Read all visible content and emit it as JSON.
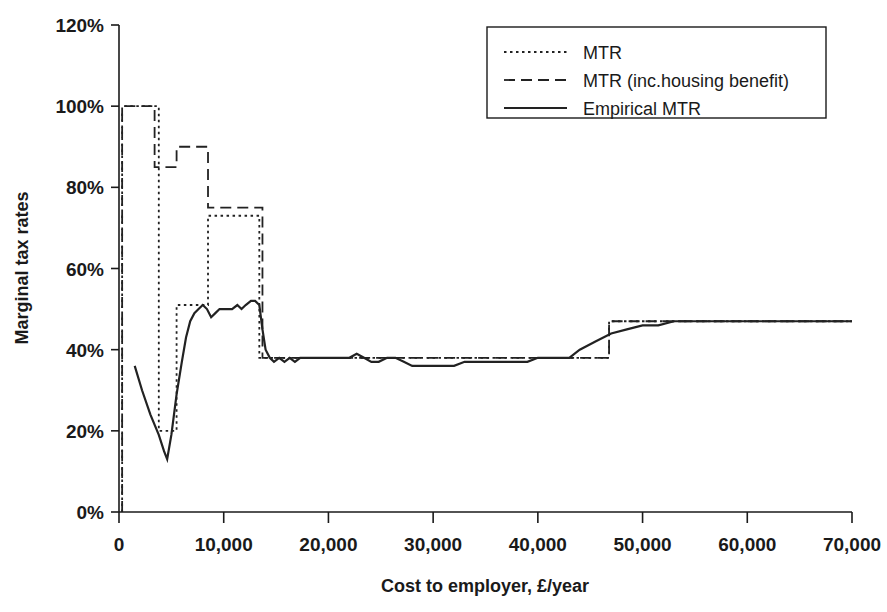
{
  "chart_data": {
    "type": "line",
    "title": "",
    "xlabel": "Cost to employer, £/year",
    "ylabel": "Marginal tax rates",
    "xlim": [
      0,
      70000
    ],
    "ylim": [
      0,
      120
    ],
    "xticks": [
      0,
      10000,
      20000,
      30000,
      40000,
      50000,
      60000,
      70000
    ],
    "xtick_labels": [
      "0",
      "10,000",
      "20,000",
      "30,000",
      "40,000",
      "50,000",
      "60,000",
      "70,000"
    ],
    "yticks": [
      0,
      20,
      40,
      60,
      80,
      100,
      120
    ],
    "ytick_labels": [
      "0%",
      "20%",
      "40%",
      "60%",
      "80%",
      "100%",
      "120%"
    ],
    "grid": false,
    "legend_position": "top-right",
    "legend_entries": [
      {
        "label": "MTR",
        "style": "dotted"
      },
      {
        "label": "MTR (inc.housing benefit)",
        "style": "dashed"
      },
      {
        "label": "Empirical MTR",
        "style": "solid"
      }
    ],
    "series": [
      {
        "name": "MTR",
        "style": "dotted",
        "step": true,
        "points": [
          [
            300,
            0
          ],
          [
            300,
            100
          ],
          [
            3800,
            100
          ],
          [
            3800,
            20
          ],
          [
            5500,
            20
          ],
          [
            5500,
            51
          ],
          [
            8500,
            51
          ],
          [
            8500,
            73
          ],
          [
            13400,
            73
          ],
          [
            13400,
            38
          ],
          [
            20000,
            38
          ],
          [
            30000,
            38
          ],
          [
            40000,
            38
          ],
          [
            46800,
            38
          ],
          [
            46800,
            47
          ],
          [
            54000,
            47
          ],
          [
            60000,
            47
          ],
          [
            70000,
            47
          ]
        ]
      },
      {
        "name": "MTR (inc.housing benefit)",
        "style": "dashed",
        "step": true,
        "points": [
          [
            300,
            0
          ],
          [
            300,
            100
          ],
          [
            3400,
            100
          ],
          [
            3400,
            85
          ],
          [
            5500,
            85
          ],
          [
            5500,
            90
          ],
          [
            8500,
            90
          ],
          [
            8500,
            75
          ],
          [
            13700,
            75
          ],
          [
            13700,
            38
          ],
          [
            20000,
            38
          ],
          [
            30000,
            38
          ],
          [
            40000,
            38
          ],
          [
            46800,
            38
          ],
          [
            46800,
            47
          ],
          [
            54000,
            47
          ],
          [
            60000,
            47
          ],
          [
            70000,
            47
          ]
        ]
      },
      {
        "name": "Empirical MTR",
        "style": "solid",
        "step": false,
        "points": [
          [
            1500,
            36
          ],
          [
            2200,
            30
          ],
          [
            3000,
            24
          ],
          [
            3800,
            19
          ],
          [
            4300,
            15
          ],
          [
            4600,
            13
          ],
          [
            5000,
            19
          ],
          [
            5500,
            29
          ],
          [
            6000,
            37
          ],
          [
            6400,
            43
          ],
          [
            6800,
            47
          ],
          [
            7200,
            49
          ],
          [
            7600,
            50
          ],
          [
            8000,
            51
          ],
          [
            8400,
            50
          ],
          [
            8800,
            48
          ],
          [
            9200,
            49
          ],
          [
            9600,
            50
          ],
          [
            10200,
            50
          ],
          [
            10800,
            50
          ],
          [
            11300,
            51
          ],
          [
            11700,
            50
          ],
          [
            12100,
            51
          ],
          [
            12600,
            52
          ],
          [
            13000,
            52
          ],
          [
            13400,
            51
          ],
          [
            13700,
            45
          ],
          [
            14000,
            40
          ],
          [
            14400,
            38
          ],
          [
            14800,
            37
          ],
          [
            15300,
            38
          ],
          [
            15800,
            37
          ],
          [
            16300,
            38
          ],
          [
            16800,
            37
          ],
          [
            17300,
            38
          ],
          [
            17900,
            38
          ],
          [
            18500,
            38
          ],
          [
            19200,
            38
          ],
          [
            19900,
            38
          ],
          [
            20600,
            38
          ],
          [
            21300,
            38
          ],
          [
            22000,
            38
          ],
          [
            22700,
            39
          ],
          [
            23400,
            38
          ],
          [
            24100,
            37
          ],
          [
            24800,
            37
          ],
          [
            25600,
            38
          ],
          [
            26400,
            38
          ],
          [
            27200,
            37
          ],
          [
            28000,
            36
          ],
          [
            29000,
            36
          ],
          [
            30000,
            36
          ],
          [
            31000,
            36
          ],
          [
            32000,
            36
          ],
          [
            33000,
            37
          ],
          [
            34000,
            37
          ],
          [
            35000,
            37
          ],
          [
            36000,
            37
          ],
          [
            37000,
            37
          ],
          [
            38000,
            37
          ],
          [
            39000,
            37
          ],
          [
            40000,
            38
          ],
          [
            41000,
            38
          ],
          [
            42000,
            38
          ],
          [
            43000,
            38
          ],
          [
            44000,
            40
          ],
          [
            45500,
            42
          ],
          [
            47000,
            44
          ],
          [
            48500,
            45
          ],
          [
            50000,
            46
          ],
          [
            51500,
            46
          ],
          [
            53000,
            47
          ],
          [
            54500,
            47
          ],
          [
            57000,
            47
          ],
          [
            60000,
            47
          ],
          [
            63000,
            47
          ],
          [
            66000,
            47
          ],
          [
            70000,
            47
          ]
        ]
      }
    ]
  },
  "colors": {
    "line": "#222222",
    "axis": "#1a1a1a",
    "background": "#ffffff"
  }
}
